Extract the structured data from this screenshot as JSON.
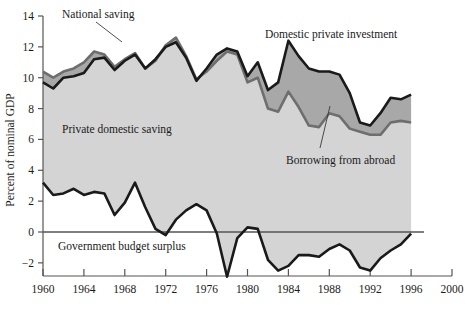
{
  "chart_data": {
    "type": "area",
    "title": "",
    "subtitle": "",
    "xlabel": "",
    "ylabel": "Percent of nominal GDP",
    "xlim": [
      1960,
      2000
    ],
    "ylim": [
      -3.6,
      14.6
    ],
    "yticks": [
      -2,
      0,
      2,
      4,
      6,
      8,
      10,
      12,
      14
    ],
    "ytick_labels": [
      "−2",
      "0",
      "2",
      "4",
      "6",
      "8",
      "10",
      "12",
      "14"
    ],
    "xticks": [
      1960,
      1964,
      1968,
      1972,
      1976,
      1980,
      1984,
      1988,
      1992,
      1996,
      2000
    ],
    "xtick_labels": [
      "1960",
      "1964",
      "1968",
      "1972",
      "1976",
      "1980",
      "1984",
      "1988",
      "1992",
      "1996",
      "2000"
    ],
    "grid": false,
    "legend_position": "inline-annotations",
    "zero_line": 0,
    "colors": {
      "light_fill": "#d4d4d4",
      "dark_fill": "#a8a8a8",
      "investment_line": "#1a1a1a",
      "saving_line": "#6e6e6e",
      "surplus_line": "#1a1a1a",
      "axis": "#555555",
      "text": "#1a1a1a",
      "background": "#ffffff"
    },
    "x": [
      1960,
      1961,
      1962,
      1963,
      1964,
      1965,
      1966,
      1967,
      1968,
      1969,
      1970,
      1971,
      1972,
      1973,
      1974,
      1975,
      1976,
      1977,
      1978,
      1979,
      1980,
      1981,
      1982,
      1983,
      1984,
      1985,
      1986,
      1987,
      1988,
      1989,
      1990,
      1991,
      1992,
      1993,
      1994,
      1995,
      1996
    ],
    "series": [
      {
        "name": "Domestic private investment",
        "role": "upper-line",
        "values": [
          9.7,
          9.3,
          10.0,
          10.1,
          10.3,
          11.2,
          11.3,
          10.5,
          11.1,
          11.5,
          10.6,
          11.2,
          12.0,
          12.3,
          11.3,
          9.8,
          10.6,
          11.5,
          11.9,
          11.7,
          10.1,
          11.0,
          9.2,
          9.7,
          12.4,
          11.4,
          10.6,
          10.4,
          10.4,
          10.2,
          9.0,
          7.1,
          6.9,
          7.7,
          8.7,
          8.6,
          8.9
        ]
      },
      {
        "name": "National saving",
        "role": "mid-line",
        "values": [
          10.4,
          10.0,
          10.4,
          10.6,
          11.0,
          11.7,
          11.5,
          10.7,
          11.2,
          11.6,
          10.6,
          11.1,
          12.1,
          12.6,
          11.4,
          9.9,
          10.4,
          11.1,
          11.7,
          11.5,
          9.7,
          10.0,
          8.0,
          7.8,
          9.1,
          8.1,
          6.9,
          6.8,
          7.7,
          7.5,
          6.7,
          6.5,
          6.3,
          6.3,
          7.1,
          7.2,
          7.1
        ]
      },
      {
        "name": "Government budget surplus",
        "role": "lower-line",
        "values": [
          3.2,
          2.4,
          2.5,
          2.8,
          2.4,
          2.6,
          2.5,
          1.1,
          1.9,
          3.2,
          1.6,
          0.2,
          -0.2,
          0.8,
          1.4,
          1.8,
          1.4,
          -0.1,
          -2.9,
          -0.4,
          0.3,
          0.2,
          -1.8,
          -2.5,
          -2.2,
          -1.5,
          -1.5,
          -1.6,
          -1.1,
          -0.8,
          -1.2,
          -2.3,
          -2.5,
          -1.7,
          -1.2,
          -0.8,
          -0.1
        ]
      }
    ],
    "annotations": [
      {
        "text": "National saving",
        "name": "annotation-national-saving",
        "x": 62,
        "y": 18,
        "leader": [
          [
            96,
            22
          ],
          [
            122,
            42
          ]
        ]
      },
      {
        "text": "Domestic private investment",
        "name": "annotation-domestic-private-investment",
        "x": 265,
        "y": 38,
        "leader": []
      },
      {
        "text": "Private domestic saving",
        "name": "annotation-private-domestic-saving",
        "x": 62,
        "y": 133,
        "leader": []
      },
      {
        "text": "Borrowing from abroad",
        "name": "annotation-borrowing-from-abroad",
        "x": 286,
        "y": 164,
        "leader": [
          [
            320,
            148
          ],
          [
            330,
            106
          ]
        ]
      },
      {
        "text": "Government budget surplus",
        "name": "annotation-government-budget-surplus",
        "x": 58,
        "y": 250,
        "leader": []
      }
    ]
  }
}
